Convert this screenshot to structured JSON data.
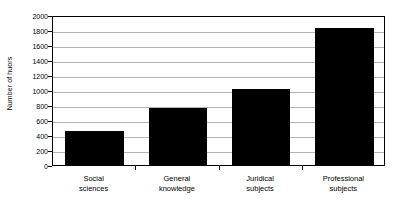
{
  "chart_data": {
    "type": "bar",
    "title": "",
    "subtitle": "",
    "xlabel": "",
    "ylabel": "Number of huors",
    "categories": [
      "Social sciences",
      "General knowledge",
      "Juridical subjects",
      "Professional subjects"
    ],
    "category_lines": [
      [
        "Social",
        "sciences"
      ],
      [
        "General",
        "knowledge"
      ],
      [
        "Juridical",
        "subjects"
      ],
      [
        "Professional",
        "subjects"
      ]
    ],
    "values": [
      450,
      760,
      1020,
      1830
    ],
    "ylim": [
      0,
      2000
    ],
    "ytick_step": 200,
    "yticks": [
      2000,
      1800,
      1600,
      1400,
      1200,
      1000,
      800,
      600,
      400,
      200,
      0
    ],
    "ytick_labels": [
      "2000",
      "1800",
      "1600",
      "1400",
      "1200",
      "1000",
      "800",
      "600",
      "400",
      "200",
      "0"
    ],
    "grid": "horizontal",
    "legend": "none",
    "bar_color": "#000000",
    "gridline_color": "#b3b3b3",
    "frame_color": "#000000",
    "background_color": "#ffffff"
  }
}
